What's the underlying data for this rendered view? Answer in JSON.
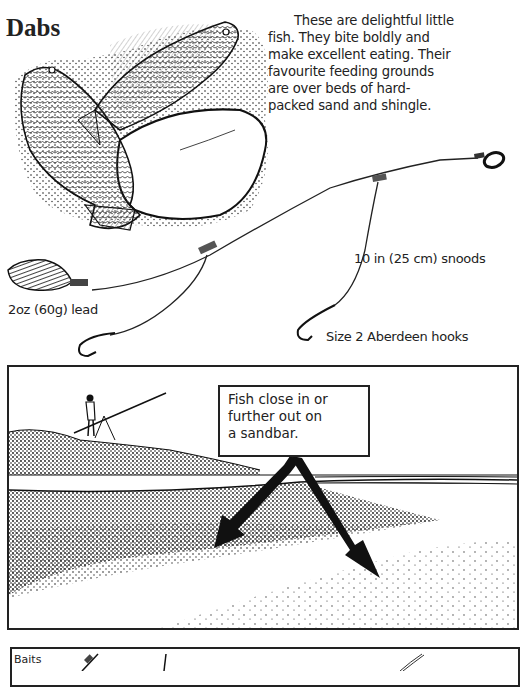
{
  "page": {
    "title": "Dabs",
    "intro_lines": [
      "These are delightful little",
      "fish. They bite boldly and",
      "make excellent eating. Their",
      "favourite feeding grounds",
      "are over beds of hard-",
      "packed sand and shingle."
    ]
  },
  "rig_diagram": {
    "labels": {
      "snoods": "10 in (25 cm) snoods",
      "lead": "2oz (60g) lead",
      "hooks": "Size 2 Aberdeen hooks"
    },
    "icons": [
      "fish-illustration",
      "lead-weight-icon",
      "swivel-ring-icon",
      "hook-icon"
    ]
  },
  "beach_panel": {
    "callout_lines": [
      "Fish close in or",
      "further out on",
      "a sandbar."
    ],
    "icons": [
      "angler-figure",
      "rod-tripod-icon",
      "arrow-left-icon",
      "arrow-right-icon"
    ]
  },
  "baits_panel": {
    "label": "Baits"
  },
  "colors": {
    "ink": "#1a1a1a",
    "paper": "#ffffff"
  }
}
